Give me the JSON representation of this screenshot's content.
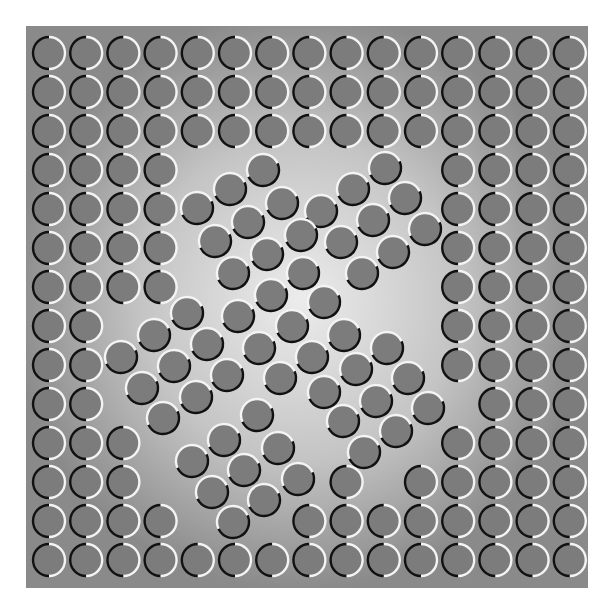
{
  "canvas": {
    "width": 611,
    "height": 611,
    "page_bg": "#ffffff"
  },
  "panel": {
    "x": 26,
    "y": 26,
    "width": 562,
    "height": 562,
    "edge_color": "#8a8a8a",
    "center_color": "#ececec",
    "gradient_center": [
      300,
      300
    ],
    "gradient_radius": 290
  },
  "style": {
    "circle_radius": 16,
    "circle_fill": "#7c7c7c",
    "stroke_width": 2.4,
    "dark_stroke": "#111111",
    "light_stroke": "#f4f4f4"
  },
  "grid": {
    "columns": 15,
    "rows": 14,
    "x0": 49,
    "dx": 37.2,
    "y0": 53,
    "dy": 39.0,
    "split": "vertical-left-dark",
    "present_columns_by_row": [
      [
        0,
        1,
        2,
        3,
        4,
        5,
        6,
        7,
        8,
        9,
        10,
        11,
        12,
        13,
        14
      ],
      [
        0,
        1,
        2,
        3,
        4,
        5,
        6,
        7,
        8,
        9,
        10,
        11,
        12,
        13,
        14
      ],
      [
        0,
        1,
        2,
        3,
        4,
        5,
        6,
        7,
        8,
        9,
        10,
        11,
        12,
        13,
        14
      ],
      [
        0,
        1,
        2,
        3,
        11,
        12,
        13,
        14
      ],
      [
        0,
        1,
        2,
        3,
        11,
        12,
        13,
        14
      ],
      [
        0,
        1,
        2,
        3,
        11,
        12,
        13,
        14
      ],
      [
        0,
        1,
        2,
        3,
        11,
        12,
        13,
        14
      ],
      [
        0,
        1,
        11,
        12,
        13,
        14
      ],
      [
        0,
        1,
        11,
        12,
        13,
        14
      ],
      [
        0,
        1,
        12,
        13,
        14
      ],
      [
        0,
        1,
        2,
        11,
        12,
        13,
        14
      ],
      [
        0,
        1,
        2,
        8,
        10,
        11,
        12,
        13,
        14
      ],
      [
        0,
        1,
        2,
        3,
        7,
        8,
        9,
        10,
        11,
        12,
        13,
        14
      ],
      [
        0,
        1,
        2,
        3,
        4,
        5,
        6,
        7,
        8,
        9,
        10,
        11,
        12,
        13,
        14
      ]
    ]
  },
  "rotated_cluster": {
    "split": "diagonal-upper-left-light",
    "light_arc_start_deg": 155,
    "light_arc_end_deg": 335,
    "circles": [
      [
        263,
        170
      ],
      [
        385,
        168
      ],
      [
        230,
        189
      ],
      [
        353,
        189
      ],
      [
        197,
        208
      ],
      [
        282,
        203
      ],
      [
        405,
        198
      ],
      [
        248,
        222
      ],
      [
        321,
        211
      ],
      [
        373,
        220
      ],
      [
        215,
        241
      ],
      [
        301,
        235
      ],
      [
        341,
        242
      ],
      [
        425,
        229
      ],
      [
        267,
        254
      ],
      [
        393,
        252
      ],
      [
        233,
        273
      ],
      [
        303,
        273
      ],
      [
        362,
        273
      ],
      [
        271,
        295
      ],
      [
        324,
        302
      ],
      [
        187,
        313
      ],
      [
        238,
        316
      ],
      [
        292,
        326
      ],
      [
        154,
        335
      ],
      [
        207,
        344
      ],
      [
        259,
        348
      ],
      [
        312,
        357
      ],
      [
        344,
        335
      ],
      [
        387,
        348
      ],
      [
        121,
        357
      ],
      [
        174,
        366
      ],
      [
        227,
        375
      ],
      [
        280,
        378
      ],
      [
        356,
        369
      ],
      [
        408,
        378
      ],
      [
        142,
        388
      ],
      [
        196,
        397
      ],
      [
        324,
        392
      ],
      [
        376,
        401
      ],
      [
        428,
        408
      ],
      [
        163,
        418
      ],
      [
        257,
        415
      ],
      [
        343,
        421
      ],
      [
        224,
        440
      ],
      [
        192,
        461
      ],
      [
        278,
        448
      ],
      [
        244,
        470
      ],
      [
        212,
        492
      ],
      [
        264,
        500
      ],
      [
        298,
        479
      ],
      [
        396,
        431
      ],
      [
        364,
        452
      ],
      [
        233,
        522
      ]
    ]
  }
}
